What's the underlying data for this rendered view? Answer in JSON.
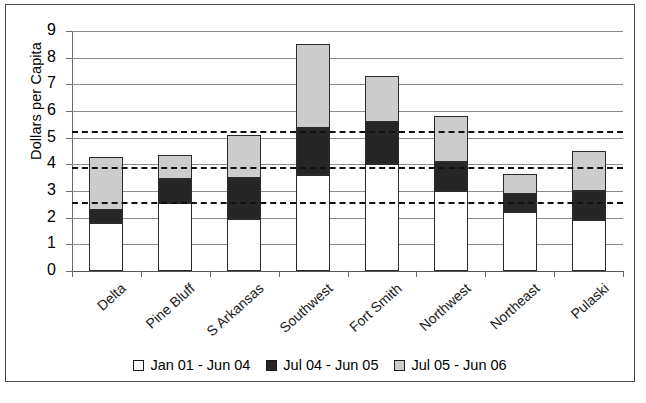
{
  "chart_data": {
    "type": "bar",
    "stacked": true,
    "title": "",
    "xlabel": "",
    "ylabel": "Dollars per Capita",
    "ylim": [
      0,
      9
    ],
    "ytick_labels": [
      "9",
      "8",
      "7",
      "6",
      "5",
      "4",
      "3",
      "2",
      "1",
      "0"
    ],
    "yticks": [
      9,
      8,
      7,
      6,
      5,
      4,
      3,
      2,
      1,
      0
    ],
    "grid": true,
    "legend_position": "bottom",
    "categories": [
      "Delta",
      "Pine Bluff",
      "S Arkansas",
      "Southwest",
      "Fort Smith",
      "Northwest",
      "Northeast",
      "Pulaski"
    ],
    "series": [
      {
        "name": "Jan 01 - Jun 04",
        "color": "#ffffff",
        "values": [
          1.8,
          2.55,
          1.95,
          3.6,
          4.0,
          3.0,
          2.2,
          1.9
        ]
      },
      {
        "name": "Jul 04 - Jun 05",
        "color": "#262626",
        "values": [
          0.5,
          0.9,
          1.55,
          1.75,
          1.6,
          1.1,
          0.7,
          1.1
        ]
      },
      {
        "name": "Jul 05 - Jun 06",
        "color": "#cccccc",
        "values": [
          1.97,
          0.9,
          1.6,
          3.15,
          1.7,
          1.7,
          0.75,
          1.5
        ]
      }
    ],
    "totals": [
      4.27,
      4.35,
      5.1,
      8.5,
      7.3,
      5.8,
      3.65,
      4.5
    ],
    "reference_lines": [
      {
        "value": 5.25,
        "style": "dashed",
        "color": "#111111"
      },
      {
        "value": 3.9,
        "style": "dashed",
        "color": "#111111"
      },
      {
        "value": 2.6,
        "style": "dashed",
        "color": "#111111"
      }
    ]
  }
}
